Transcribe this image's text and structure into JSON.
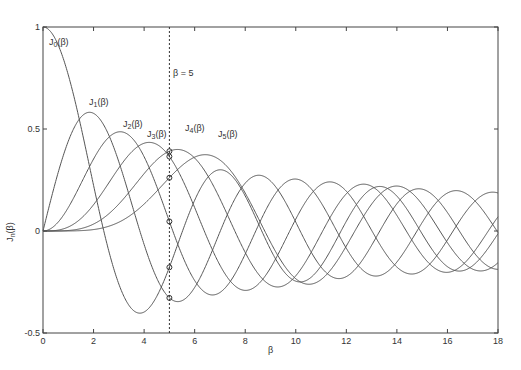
{
  "chart_data": {
    "type": "line",
    "title": "",
    "xlabel": "β",
    "ylabel": "J_n(β)",
    "xlim": [
      0,
      18
    ],
    "ylim": [
      -0.5,
      1
    ],
    "grid": false,
    "x_ticks": [
      "0",
      "2",
      "4",
      "6",
      "8",
      "10",
      "12",
      "14",
      "16",
      "18"
    ],
    "y_ticks": [
      "-0.5",
      "0",
      "0.5",
      "1"
    ],
    "series": [
      {
        "name": "J0(β)",
        "order": 0
      },
      {
        "name": "J1(β)",
        "order": 1
      },
      {
        "name": "J2(β)",
        "order": 2
      },
      {
        "name": "J3(β)",
        "order": 3
      },
      {
        "name": "J4(β)",
        "order": 4
      },
      {
        "name": "J5(β)",
        "order": 5
      }
    ],
    "annotations": [
      {
        "text": "β = 5",
        "type": "vertical-dashed-line",
        "x": 5
      }
    ],
    "markers_at_beta_5": [
      {
        "series": "J0(β)",
        "y": -0.178
      },
      {
        "series": "J1(β)",
        "y": -0.328
      },
      {
        "series": "J2(β)",
        "y": 0.047
      },
      {
        "series": "J3(β)",
        "y": 0.365
      },
      {
        "series": "J4(β)",
        "y": 0.391
      },
      {
        "series": "J5(β)",
        "y": 0.261
      }
    ]
  },
  "labels": {
    "xlabel": "β",
    "ylabel_main": "J",
    "ylabel_sub": "n",
    "ylabel_arg": "(β)",
    "vline": "β = 5",
    "curves": [
      {
        "main": "J",
        "sub": "0",
        "arg": "(β)"
      },
      {
        "main": "J",
        "sub": "1",
        "arg": "(β)"
      },
      {
        "main": "J",
        "sub": "2",
        "arg": "(β)"
      },
      {
        "main": "J",
        "sub": "3",
        "arg": "(β)"
      },
      {
        "main": "J",
        "sub": "4",
        "arg": "(β)"
      },
      {
        "main": "J",
        "sub": "5",
        "arg": "(β)"
      }
    ]
  }
}
